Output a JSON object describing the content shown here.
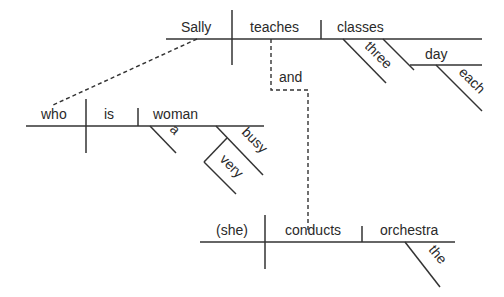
{
  "diagram": {
    "type": "sentence-diagram",
    "colors": {
      "line": "#333333",
      "text": "#2a2a2a",
      "background": "#ffffff"
    },
    "main_clause": {
      "subject": "Sally",
      "verb": "teaches",
      "object": "classes",
      "modifiers": {
        "three": "three",
        "day": "day",
        "each": "each"
      }
    },
    "conjunction": "and",
    "relative_clause": {
      "subject": "who",
      "verb": "is",
      "complement": "woman",
      "modifiers": {
        "a": "a",
        "busy": "busy",
        "very": "very"
      }
    },
    "second_clause": {
      "subject": "(she)",
      "verb": "conducts",
      "object": "orchestra",
      "modifiers": {
        "the": "the"
      }
    }
  }
}
